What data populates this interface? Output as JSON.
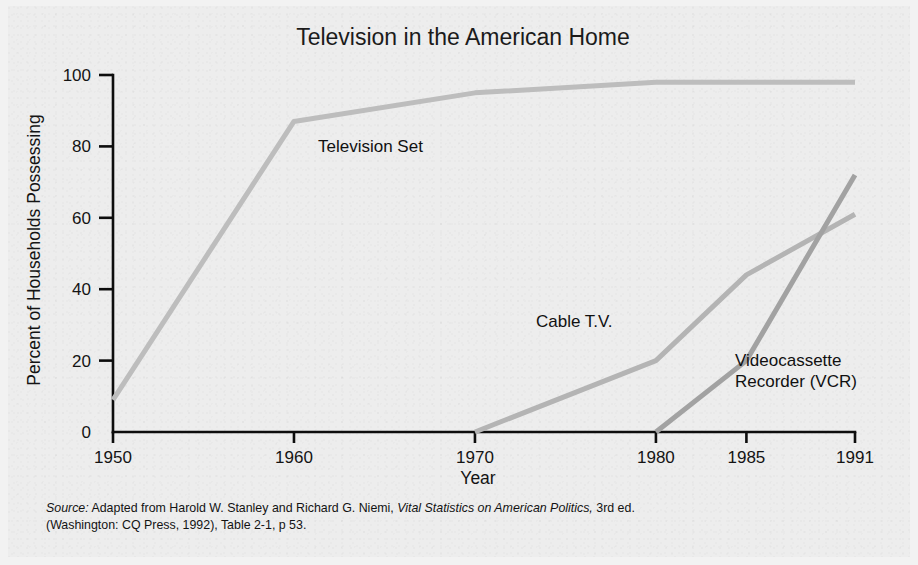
{
  "figure": {
    "background_color": "#ededed",
    "outer_color": "#f2f2f2"
  },
  "chart_data": {
    "type": "line",
    "title": "Television in the American Home",
    "xlabel": "Year",
    "ylabel": "Percent of Households Possessing",
    "categories": [
      "1950",
      "1960",
      "1970",
      "1980",
      "1985",
      "1991"
    ],
    "category_positions": [
      0,
      10,
      20,
      30,
      35,
      41
    ],
    "xlim": [
      0,
      41
    ],
    "ylim": [
      0,
      100
    ],
    "yticks": [
      0,
      20,
      40,
      60,
      80,
      100
    ],
    "ytick_labels": [
      "0",
      "20",
      "40",
      "60",
      "80",
      "100"
    ],
    "grid": false,
    "legend_position": "inline-labels",
    "series": [
      {
        "name": "Television Set",
        "color": "#bdbdbd",
        "line_width": 5,
        "x": [
          "1950",
          "1960",
          "1970",
          "1980",
          "1985",
          "1991"
        ],
        "values": [
          9,
          87,
          95,
          98,
          98,
          98
        ],
        "label": "Television Set",
        "label_x": 318,
        "label_y": 152
      },
      {
        "name": "Cable T.V.",
        "color": "#b4b4b4",
        "line_width": 5,
        "x": [
          "1970",
          "1980",
          "1985",
          "1991"
        ],
        "values": [
          0,
          20,
          44,
          61
        ],
        "label": "Cable T.V.",
        "label_x": 536,
        "label_y": 327
      },
      {
        "name": "Videocassette Recorder (VCR)",
        "color": "#a2a2a2",
        "line_width": 5,
        "x": [
          "1980",
          "1985",
          "1991"
        ],
        "values": [
          0,
          20,
          72
        ],
        "label_line_1": "Videocassette",
        "label_line_2": "Recorder (VCR)",
        "label_x": 735,
        "label_y": 366
      }
    ]
  },
  "source": {
    "label": "Source:",
    "line1_rest": " Adapted from Harold W. Stanley and Richard G. Niemi, ",
    "book": "Vital Statistics on American Politics,",
    "line1_tail": " 3rd ed.",
    "line2": "(Washington: CQ Press, 1992), Table 2-1, p 53."
  }
}
